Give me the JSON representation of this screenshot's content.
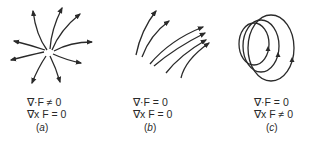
{
  "figure": {
    "panels": [
      {
        "id": "a",
        "field_type": "source (radial outward)",
        "equations": [
          "∇·F ≠ 0",
          "∇x F = 0"
        ],
        "caption_open": "(",
        "caption_letter": "a",
        "caption_close": ")"
      },
      {
        "id": "b",
        "field_type": "uniform curved flow",
        "equations": [
          "∇·F = 0",
          "∇x F = 0"
        ],
        "caption_open": "(",
        "caption_letter": "b",
        "caption_close": ")"
      },
      {
        "id": "c",
        "field_type": "circulating closed loops",
        "equations": [
          "∇·F = 0",
          "∇x F ≠ 0"
        ],
        "caption_open": "(",
        "caption_letter": "c",
        "caption_close": ")"
      }
    ],
    "stroke_color": "#2a2a2a"
  }
}
